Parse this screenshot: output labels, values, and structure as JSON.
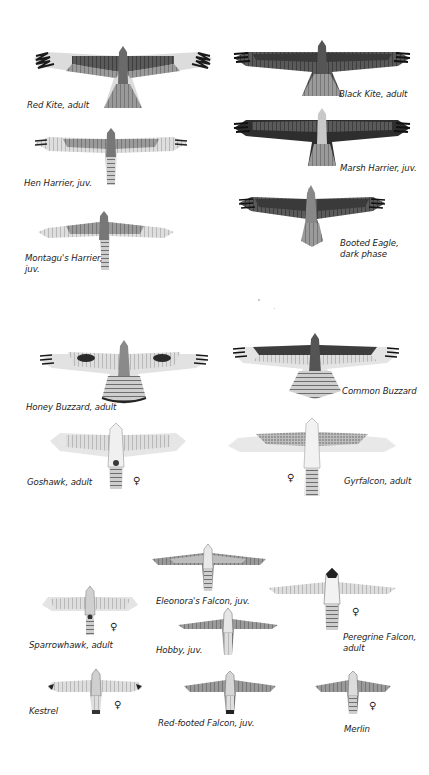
{
  "plate": {
    "sections": [
      {
        "name": "kites-harriers-eagle",
        "birds": [
          {
            "id": "red-kite",
            "label": "Red Kite, adult"
          },
          {
            "id": "black-kite",
            "label": "Black Kite, adult"
          },
          {
            "id": "hen-harrier",
            "label": "Hen Harrier, juv."
          },
          {
            "id": "marsh-harrier",
            "label": "Marsh Harrier, juv."
          },
          {
            "id": "montagus-harrier",
            "label_line1": "Montagu's Harrier,",
            "label_line2": "juv."
          },
          {
            "id": "booted-eagle",
            "label_line1": "Booted Eagle,",
            "label_line2": "dark phase"
          }
        ]
      },
      {
        "name": "buzzards-goshawk-gyrfalcon",
        "birds": [
          {
            "id": "honey-buzzard",
            "label": "Honey Buzzard, adult"
          },
          {
            "id": "common-buzzard",
            "label": "Common Buzzard"
          },
          {
            "id": "goshawk",
            "label": "Goshawk, adult",
            "sex": "♀"
          },
          {
            "id": "gyrfalcon",
            "label": "Gyrfalcon, adult",
            "sex": "♀"
          }
        ]
      },
      {
        "name": "small-falcons-hawks",
        "birds": [
          {
            "id": "eleonoras-falcon",
            "label": "Eleonora's Falcon, juv."
          },
          {
            "id": "sparrowhawk",
            "label": "Sparrowhawk, adult",
            "sex": "♀"
          },
          {
            "id": "peregrine-falcon",
            "label_line1": "Peregrine Falcon,",
            "label_line2": "adult",
            "sex": "♀"
          },
          {
            "id": "hobby",
            "label": "Hobby, juv."
          },
          {
            "id": "kestrel",
            "label": "Kestrel",
            "sex": "♀"
          },
          {
            "id": "red-footed-falcon",
            "label": "Red-footed Falcon, juv."
          },
          {
            "id": "merlin",
            "label": "Merlin",
            "sex": "♀"
          }
        ]
      }
    ],
    "colors": {
      "ink": "#1e1e1e",
      "dark_plumage": "#3a3a3a",
      "mid_plumage": "#777777",
      "light_plumage": "#c9c9c9",
      "pale_plumage": "#e6e6e6"
    }
  }
}
